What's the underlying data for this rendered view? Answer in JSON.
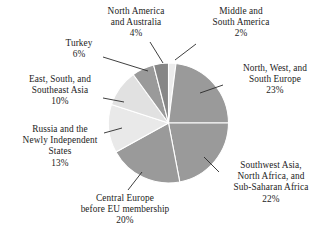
{
  "chart_data": {
    "type": "pie",
    "title": "",
    "subtitle": "",
    "xlabel": "",
    "ylabel": "",
    "legend_position": "none",
    "labels_position": "outside-with-leader-lines",
    "grid": false,
    "units": "percent",
    "total": 100,
    "start_angle_deg": 0,
    "direction": "clockwise",
    "categories": [
      "Middle and South America",
      "North, West, and South Europe",
      "Southwest Asia, North Africa, and Sub-Saharan Africa",
      "Central Europe before EU membership",
      "Russia and the Newly Independent States",
      "East, South, and Southeast Asia",
      "Turkey",
      "North America and Australia"
    ],
    "values": [
      2,
      23,
      22,
      20,
      13,
      10,
      6,
      4
    ],
    "colors": [
      "#ececec",
      "#9a9a9a",
      "#9a9a9a",
      "#9a9a9a",
      "#e9e9e9",
      "#e1e1e1",
      "#9a9a9a",
      "#868686"
    ],
    "slices": [
      {
        "name": "middle-and-south-america",
        "value": 2,
        "percent_label": "2%",
        "color": "#ececec"
      },
      {
        "name": "north-west-and-south-europe",
        "value": 23,
        "percent_label": "23%",
        "color": "#9a9a9a"
      },
      {
        "name": "southwest-asia-north-africa-sub-saharan-africa",
        "value": 22,
        "percent_label": "22%",
        "color": "#9a9a9a"
      },
      {
        "name": "central-europe-before-eu-membership",
        "value": 20,
        "percent_label": "20%",
        "color": "#9a9a9a"
      },
      {
        "name": "russia-and-the-newly-independent-states",
        "value": 13,
        "percent_label": "13%",
        "color": "#e9e9e9"
      },
      {
        "name": "east-south-and-southeast-asia",
        "value": 10,
        "percent_label": "10%",
        "color": "#e1e1e1"
      },
      {
        "name": "turkey",
        "value": 6,
        "percent_label": "6%",
        "color": "#9a9a9a"
      },
      {
        "name": "north-america-and-australia",
        "value": 4,
        "percent_label": "4%",
        "color": "#868686"
      }
    ]
  },
  "labels": {
    "north_america": {
      "line1": "North America",
      "line2": "and Australia",
      "pct": "4%"
    },
    "middle_south_america": {
      "line1": "Middle and",
      "line2": "South America",
      "pct": "2%"
    },
    "north_west_south_europe": {
      "line1": "North, West, and",
      "line2": "South Europe",
      "pct": "23%"
    },
    "southwest_asia": {
      "line1": "Southwest Asia,",
      "line2": "North Africa, and",
      "line3": "Sub-Saharan Africa",
      "pct": "22%"
    },
    "central_europe": {
      "line1": "Central Europe",
      "line2": "before EU membership",
      "pct": "20%"
    },
    "russia": {
      "line1": "Russia and the",
      "line2": "Newly Independent",
      "line3": "States",
      "pct": "13%"
    },
    "east_south_southeast_asia": {
      "line1": "East, South, and",
      "line2": "Southeast Asia",
      "pct": "10%"
    },
    "turkey": {
      "line1": "Turkey",
      "pct": "6%"
    }
  },
  "style": {
    "background": "#ffffff",
    "text_color": "#1c1c1c",
    "separator_color": "#ffffff",
    "leader_line_color": "#2a2a2a"
  }
}
